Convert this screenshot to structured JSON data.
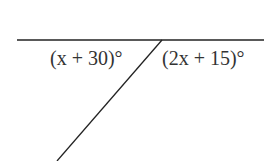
{
  "diagram": {
    "type": "angles-on-straight-line",
    "angles": [
      {
        "label": "(x + 30)°",
        "position": "left"
      },
      {
        "label": "(2x + 15)°",
        "position": "right"
      }
    ],
    "line_color": "#222222"
  }
}
